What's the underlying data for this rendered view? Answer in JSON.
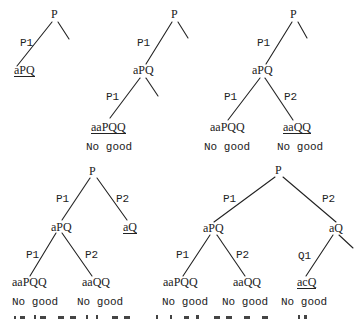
{
  "figure": {
    "colors": {
      "ink": "#222222",
      "background": "#ffffff"
    },
    "trees": [
      {
        "id": "tree-1",
        "root": "P",
        "edges": [
          "P1"
        ],
        "nodes": [
          "aPQ"
        ],
        "underlined": [
          "aPQ"
        ],
        "verdicts": []
      },
      {
        "id": "tree-2",
        "root": "P",
        "edges": [
          "P1",
          "P1"
        ],
        "nodes": [
          "aPQ",
          "aaPQQ"
        ],
        "underlined": [
          "aaPQQ"
        ],
        "verdicts": [
          "No good"
        ]
      },
      {
        "id": "tree-3",
        "root": "P",
        "edges": [
          "P1",
          "P1",
          "P2"
        ],
        "nodes": [
          "aPQ",
          "aaPQQ",
          "aaQQ"
        ],
        "underlined": [
          "aaQQ"
        ],
        "verdicts": [
          "No good",
          "No good"
        ]
      },
      {
        "id": "tree-4",
        "root": "P",
        "edges": [
          "P1",
          "P2",
          "P1",
          "P2"
        ],
        "nodes": [
          "aPQ",
          "aQ",
          "aaPQQ",
          "aaQQ"
        ],
        "underlined": [
          "aQ"
        ],
        "verdicts": [
          "No good",
          "No good"
        ]
      },
      {
        "id": "tree-5",
        "root": "P",
        "edges": [
          "P1",
          "P2",
          "P1",
          "P2",
          "Q1"
        ],
        "nodes": [
          "aPQ",
          "aQ",
          "aaPQQ",
          "aaQQ",
          "acQ"
        ],
        "underlined": [
          "acQ"
        ],
        "verdicts": [
          "No good",
          "No good",
          "No good"
        ]
      }
    ]
  }
}
